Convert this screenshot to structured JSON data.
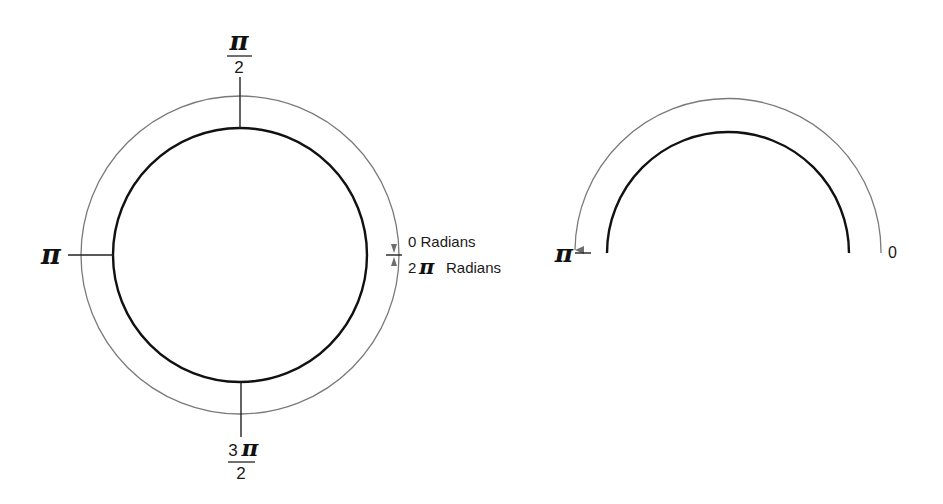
{
  "diagram": {
    "full_circle": {
      "labels": {
        "top": {
          "numerator": "π",
          "denominator": "2"
        },
        "left": "π",
        "bottom": {
          "numerator_digit": "3",
          "numerator_symbol": "π",
          "denominator": "2"
        },
        "right_upper": "0 Radians",
        "right_lower_digit": "2",
        "right_lower_symbol": "π",
        "right_lower_text": "Radians"
      },
      "inner_circle": {
        "cx": 240,
        "cy": 255,
        "r": 127
      },
      "outer_arc": {
        "cx": 240,
        "cy": 255,
        "r": 159
      }
    },
    "half_circle": {
      "labels": {
        "left": "π",
        "right": "0"
      },
      "inner_arc": {
        "cx": 728,
        "cy": 253,
        "r": 121
      },
      "outer_arc": {
        "cx": 728,
        "cy": 253,
        "r": 153
      }
    },
    "colors": {
      "inner_stroke": "#111111",
      "outer_stroke": "#7a7a7a",
      "text": "#1a1a1a"
    }
  }
}
